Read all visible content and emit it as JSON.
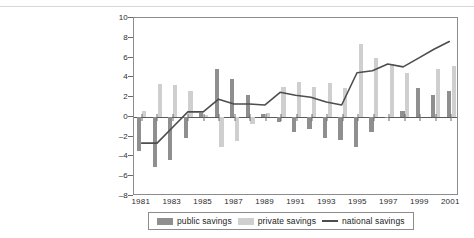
{
  "chart_data": {
    "type": "bar",
    "title": "",
    "subtitle": "",
    "xlabel": "",
    "ylabel": "",
    "grid": false,
    "legend_position": "bottom",
    "ylim": [
      -8,
      10
    ],
    "ytick_values": [
      10,
      8,
      6,
      4,
      2,
      0,
      -2,
      -4,
      -6,
      -8
    ],
    "ytick_labels": [
      "10",
      "8",
      "6",
      "4",
      "2",
      "0",
      "-2",
      "-4",
      "-6",
      "-8"
    ],
    "x": [
      1981,
      1982,
      1983,
      1984,
      1985,
      1986,
      1987,
      1988,
      1989,
      1990,
      1991,
      1992,
      1993,
      1994,
      1995,
      1996,
      1997,
      1998,
      1999,
      2000,
      2001
    ],
    "categories": [
      "1981",
      "1982",
      "1983",
      "1984",
      "1985",
      "1986",
      "1987",
      "1988",
      "1989",
      "1990",
      "1991",
      "1992",
      "1993",
      "1994",
      "1995",
      "1996",
      "1997",
      "1998",
      "1999",
      "2000",
      "2001"
    ],
    "xtick_values": [
      1981,
      1983,
      1985,
      1987,
      1989,
      1991,
      1993,
      1995,
      1997,
      1999,
      2001
    ],
    "xtick_labels": [
      "1981",
      "1983",
      "1985",
      "1987",
      "1989",
      "1991",
      "1993",
      "1995",
      "1997",
      "1999",
      "2001"
    ],
    "series": [
      {
        "name": "public savings",
        "kind": "bar",
        "color": "#8f8f8f",
        "values": [
          -3.5,
          -5.1,
          -4.4,
          -2.1,
          0.4,
          4.8,
          3.8,
          2.2,
          0.3,
          -0.5,
          -1.5,
          -1.2,
          -2.1,
          -2.3,
          -3.0,
          -1.5,
          -0.1,
          0.6,
          2.9,
          2.2,
          2.6
        ]
      },
      {
        "name": "private savings",
        "kind": "bar",
        "color": "#cfcfcf",
        "values": [
          0.6,
          3.3,
          3.2,
          2.6,
          0.2,
          -3.0,
          -2.4,
          -0.7,
          0.4,
          3.0,
          3.5,
          3.0,
          3.4,
          2.9,
          7.4,
          6.0,
          5.3,
          4.4,
          0.0,
          4.8,
          5.1
        ]
      },
      {
        "name": "national savings",
        "kind": "line",
        "color": "#4d4d4d",
        "values": [
          -2.8,
          -2.8,
          -1.2,
          0.4,
          0.4,
          1.7,
          1.2,
          1.2,
          1.1,
          2.4,
          2.1,
          1.9,
          1.4,
          1.1,
          4.4,
          4.6,
          5.3,
          5.0,
          5.9,
          6.8,
          7.6
        ]
      }
    ]
  },
  "legend": {
    "items": [
      {
        "label": "public savings",
        "swatch": "public-bar-swatch"
      },
      {
        "label": "private savings",
        "swatch": "private-bar-swatch"
      },
      {
        "label": "national savings",
        "swatch": "national-line-swatch"
      }
    ]
  },
  "colors": {
    "public": "#8f8f8f",
    "private": "#cfcfcf",
    "national": "#4d4d4d",
    "axis": "#6a6a6a",
    "frame": "#8c8c8c",
    "background": "#ffffff"
  }
}
